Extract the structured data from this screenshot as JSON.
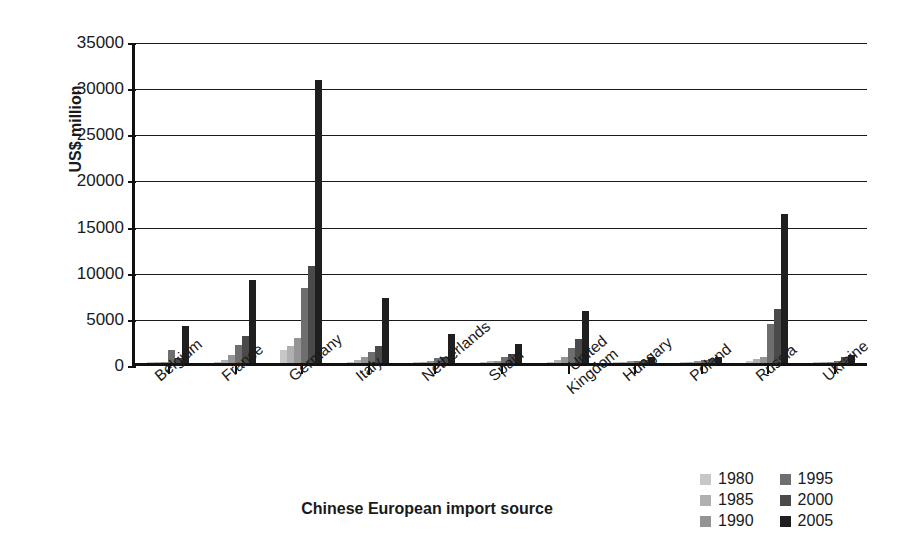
{
  "chart_data": {
    "type": "bar",
    "title": "",
    "xlabel": "Chinese European import source",
    "ylabel": "US$ million",
    "ylim": [
      0,
      35000
    ],
    "ystep": 5000,
    "yticks": [
      "35000",
      "30000",
      "25000",
      "20000",
      "15000",
      "10000",
      "5000",
      "0"
    ],
    "grid": true,
    "legend_position": "bottom-right",
    "categories": [
      "Belgium",
      "France",
      "Germany",
      "Italy",
      "Netherlands",
      "Spain",
      "United Kingdom",
      "Hungary",
      "Poland",
      "Russia",
      "Ukraine"
    ],
    "category_lines": [
      [
        "Belgium"
      ],
      [
        "France"
      ],
      [
        "Germany"
      ],
      [
        "Italy"
      ],
      [
        "Netherlands"
      ],
      [
        "Spain"
      ],
      [
        "United",
        "Kingdom"
      ],
      [
        "Hungary"
      ],
      [
        "Poland"
      ],
      [
        "Russia"
      ],
      [
        "Ukraine"
      ]
    ],
    "series": [
      {
        "name": "1980",
        "color": "#c7c7c7",
        "values": [
          60,
          90,
          1400,
          150,
          60,
          120,
          150,
          80,
          90,
          250,
          60
        ]
      },
      {
        "name": "1985",
        "color": "#b0b0b0",
        "values": [
          90,
          300,
          1800,
          350,
          120,
          180,
          300,
          120,
          150,
          400,
          100
        ]
      },
      {
        "name": "1990",
        "color": "#949494",
        "values": [
          150,
          900,
          2700,
          600,
          200,
          250,
          700,
          180,
          200,
          700,
          150
        ]
      },
      {
        "name": "1995",
        "color": "#6e6e6e",
        "values": [
          1400,
          1900,
          8100,
          1200,
          500,
          650,
          1600,
          250,
          300,
          4200,
          250
        ]
      },
      {
        "name": "2000",
        "color": "#4a4a4a",
        "values": [
          500,
          2900,
          10500,
          1800,
          700,
          1000,
          2600,
          350,
          400,
          5900,
          700
        ]
      },
      {
        "name": "2005",
        "color": "#1f1f1f",
        "values": [
          4000,
          9000,
          30700,
          7000,
          3100,
          2100,
          5600,
          600,
          700,
          16100,
          900
        ]
      }
    ]
  },
  "legend": {
    "entries": [
      {
        "label": "1980",
        "color": "#c7c7c7"
      },
      {
        "label": "1995",
        "color": "#6e6e6e"
      },
      {
        "label": "1985",
        "color": "#b0b0b0"
      },
      {
        "label": "2000",
        "color": "#4a4a4a"
      },
      {
        "label": "1990",
        "color": "#949494"
      },
      {
        "label": "2005",
        "color": "#1f1f1f"
      }
    ]
  }
}
